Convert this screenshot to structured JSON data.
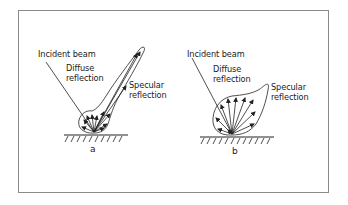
{
  "figure": {
    "panels": [
      {
        "id": "a",
        "caption": "a",
        "labels": {
          "incident": "Incident beam",
          "diffuse_line1": "Diffuse",
          "diffuse_line2": "reflection",
          "specular_line1": "Specular",
          "specular_line2": "reflection"
        }
      },
      {
        "id": "b",
        "caption": "b",
        "labels": {
          "incident": "Incident beam",
          "diffuse_line1": "Diffuse",
          "diffuse_line2": "reflection",
          "specular_line1": "Specular",
          "specular_line2": "reflection"
        }
      }
    ],
    "colors": {
      "stroke": "#222222",
      "frame": "#8a8a8a",
      "background": "#ffffff"
    }
  }
}
